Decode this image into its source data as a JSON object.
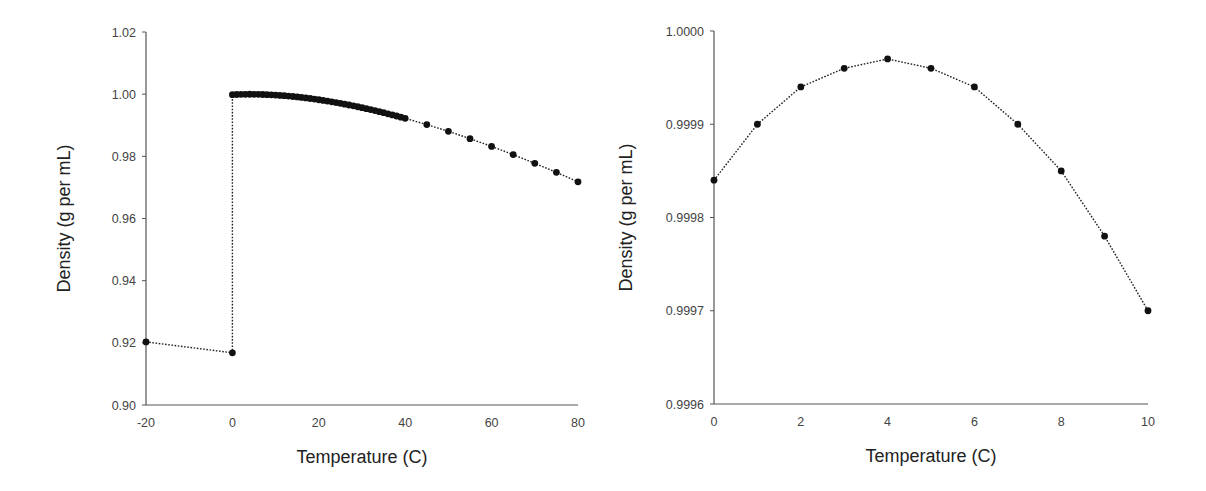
{
  "chart_data": [
    {
      "type": "line",
      "title": "",
      "xlabel": "Temperature (C)",
      "ylabel": "Density (g per mL)",
      "xlim": [
        -20,
        80
      ],
      "ylim": [
        0.9,
        1.02
      ],
      "x_ticks": [
        "-20",
        "0",
        "20",
        "40",
        "60",
        "80"
      ],
      "y_ticks": [
        "0.90",
        "0.92",
        "0.94",
        "0.96",
        "0.98",
        "1.00",
        "1.02"
      ],
      "grid": false,
      "legend": null,
      "line_style": "dotted",
      "marker": "circle",
      "series": [
        {
          "name": "Ice",
          "x": [
            -20,
            0
          ],
          "y": [
            0.9203,
            0.9168
          ]
        },
        {
          "name": "Water",
          "x": [
            0,
            1,
            2,
            3,
            4,
            5,
            6,
            7,
            8,
            9,
            10,
            11,
            12,
            13,
            14,
            15,
            16,
            17,
            18,
            19,
            20,
            21,
            22,
            23,
            24,
            25,
            26,
            27,
            28,
            29,
            30,
            31,
            32,
            33,
            34,
            35,
            36,
            37,
            38,
            39,
            40,
            45,
            50,
            55,
            60,
            65,
            70,
            75,
            80
          ],
          "y": [
            0.99984,
            0.9999,
            0.99994,
            0.99996,
            0.99997,
            0.99996,
            0.99994,
            0.9999,
            0.99985,
            0.99978,
            0.9997,
            0.99961,
            0.9995,
            0.99938,
            0.99925,
            0.9991,
            0.99895,
            0.99878,
            0.9986,
            0.99841,
            0.99821,
            0.998,
            0.99777,
            0.99754,
            0.9973,
            0.99705,
            0.99679,
            0.99652,
            0.99624,
            0.99595,
            0.99565,
            0.99534,
            0.99503,
            0.99471,
            0.99437,
            0.99403,
            0.99369,
            0.99333,
            0.99297,
            0.9926,
            0.99222,
            0.99021,
            0.98804,
            0.98569,
            0.9832,
            0.98055,
            0.97776,
            0.97484,
            0.97179
          ]
        }
      ]
    },
    {
      "type": "line",
      "title": "",
      "xlabel": "Temperature (C)",
      "ylabel": "Density (g per mL)",
      "xlim": [
        0,
        10
      ],
      "ylim": [
        0.9996,
        1.0
      ],
      "x_ticks": [
        "0",
        "2",
        "4",
        "6",
        "8",
        "10"
      ],
      "y_ticks": [
        "0.9996",
        "0.9997",
        "0.9998",
        "0.9999",
        "1.0000"
      ],
      "grid": false,
      "legend": null,
      "line_style": "dotted",
      "marker": "circle",
      "series": [
        {
          "name": "Water",
          "x": [
            0,
            1,
            2,
            3,
            4,
            5,
            6,
            7,
            8,
            9,
            10
          ],
          "y": [
            0.99984,
            0.9999,
            0.99994,
            0.99996,
            0.99997,
            0.99996,
            0.99994,
            0.9999,
            0.99985,
            0.99978,
            0.9997
          ]
        }
      ]
    }
  ],
  "layout": [
    {
      "plot": {
        "left": 146,
        "right": 578,
        "top": 32,
        "bottom": 405
      }
    },
    {
      "plot": {
        "left": 714,
        "right": 1148,
        "top": 31,
        "bottom": 404
      }
    }
  ],
  "colors": {
    "axis": "#555555",
    "line": "#222222",
    "marker": "#111111"
  }
}
